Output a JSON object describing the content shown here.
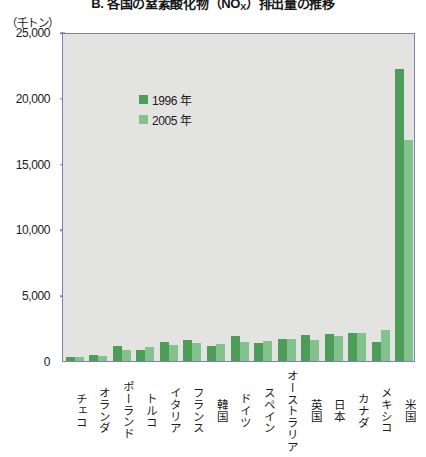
{
  "title": {
    "prefix": "B. 各国の窒素酸化物（NO",
    "sub": "X",
    "suffix": "）排出量の推移"
  },
  "unit_label": "（千トン）",
  "legend": [
    {
      "label": "1996 年",
      "color": "#4d9c58"
    },
    {
      "label": "2005 年",
      "color": "#84c28d"
    }
  ],
  "y_axis": {
    "ticks": [
      "0",
      "5,000",
      "10,000",
      "15,000",
      "20,000",
      "25,000"
    ]
  },
  "chart_data": {
    "type": "bar",
    "title": "B. 各国の窒素酸化物（NOX）排出量の推移",
    "xlabel": "",
    "ylabel": "千トン",
    "ylim": [
      0,
      25000
    ],
    "yticks": [
      0,
      5000,
      10000,
      15000,
      20000,
      25000
    ],
    "grid": false,
    "legend_position": "top-left",
    "categories": [
      "チェコ",
      "オランダ",
      "ポーランド",
      "トルコ",
      "イタリア",
      "フランス",
      "韓国",
      "ドイツ",
      "スペイン",
      "オーストラリア",
      "英国",
      "日本",
      "カナダ",
      "メキシコ",
      "米国"
    ],
    "series": [
      {
        "name": "1996 年",
        "color": "#4d9c58",
        "values": [
          320,
          430,
          1120,
          870,
          1480,
          1620,
          1150,
          1920,
          1380,
          1700,
          2000,
          2030,
          2130,
          1420,
          22200
        ]
      },
      {
        "name": "2005 年",
        "color": "#84c28d",
        "values": [
          270,
          350,
          810,
          1030,
          1250,
          1340,
          1270,
          1460,
          1490,
          1650,
          1620,
          1930,
          2120,
          2350,
          16800
        ]
      }
    ]
  }
}
